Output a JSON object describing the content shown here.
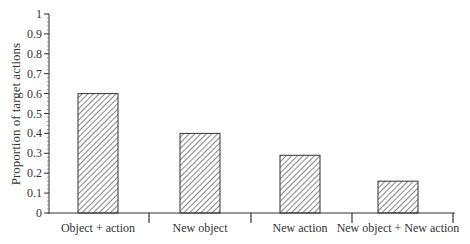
{
  "chart_data": {
    "type": "bar",
    "title": "",
    "xlabel": "",
    "ylabel": "Proportion of target actions",
    "categories": [
      "Object + action",
      "New object",
      "New action",
      "New object + New action"
    ],
    "values": [
      0.6,
      0.4,
      0.29,
      0.16
    ],
    "ylim": [
      0,
      1
    ],
    "yticks": [
      "0",
      "0.1",
      "0.2",
      "0.3",
      "0.4",
      "0.5",
      "0.6",
      "0.7",
      "0.8",
      "0.9",
      "1"
    ],
    "grid": false,
    "legend": null,
    "bar_fill": "diagonal-hatch",
    "colors": {
      "axis": "#333333",
      "bar_stroke": "#333333",
      "hatch": "#444444"
    }
  }
}
